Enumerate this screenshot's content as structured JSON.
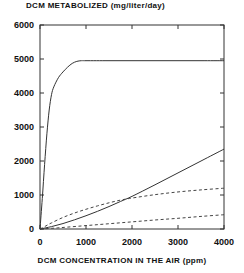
{
  "chart_data": {
    "type": "line",
    "title": "DCM METABOLIZED (mg/liter/day)",
    "xlabel": "DCM CONCENTRATION IN THE AIR (ppm)",
    "ylabel": "DCM METABOLIZED (mg/liter/day)",
    "xlim": [
      0,
      4000
    ],
    "ylim": [
      0,
      6000
    ],
    "grid": false,
    "legend": "none",
    "frame": "box",
    "xticks": [
      0,
      1000,
      2000,
      3000,
      4000
    ],
    "yticks": [
      0,
      1000,
      2000,
      3000,
      4000,
      5000,
      6000
    ],
    "xtick_labels": [
      "0",
      "1000",
      "2000",
      "3000",
      "4000"
    ],
    "ytick_labels": [
      "0",
      "1000",
      "2000",
      "3000",
      "4000",
      "5000",
      "6000"
    ],
    "series": [
      {
        "name": "saturating-metabolism-curve",
        "style": "solid",
        "color": "#333333",
        "x": [
          0,
          50,
          100,
          150,
          200,
          250,
          300,
          400,
          500,
          600,
          700,
          800,
          900,
          1000,
          1500,
          2000,
          2500,
          3000,
          3500,
          4000
        ],
        "values": [
          0,
          900,
          1900,
          2800,
          3500,
          3950,
          4180,
          4450,
          4620,
          4760,
          4870,
          4930,
          4950,
          4950,
          4950,
          4950,
          4950,
          4950,
          4950,
          4950
        ]
      },
      {
        "name": "linear-uptake-line",
        "style": "solid",
        "color": "#333333",
        "x": [
          0,
          250,
          500,
          750,
          1000,
          1250,
          1500,
          1750,
          2000,
          2500,
          3000,
          3500,
          4000
        ],
        "values": [
          0,
          70,
          160,
          270,
          390,
          520,
          660,
          810,
          960,
          1300,
          1650,
          2000,
          2350
        ]
      },
      {
        "name": "upper-dashed-curve",
        "style": "dashed",
        "color": "#444444",
        "x": [
          0,
          100,
          250,
          500,
          750,
          1000,
          1250,
          1500,
          1750,
          2000,
          2500,
          3000,
          3500,
          4000
        ],
        "values": [
          0,
          70,
          180,
          340,
          470,
          580,
          680,
          770,
          850,
          910,
          1010,
          1090,
          1150,
          1200
        ]
      },
      {
        "name": "lower-dashed-curve",
        "style": "dashed",
        "color": "#444444",
        "x": [
          0,
          250,
          500,
          1000,
          1500,
          2000,
          2500,
          3000,
          3500,
          4000
        ],
        "values": [
          0,
          20,
          45,
          100,
          155,
          210,
          265,
          315,
          370,
          420
        ]
      }
    ]
  }
}
